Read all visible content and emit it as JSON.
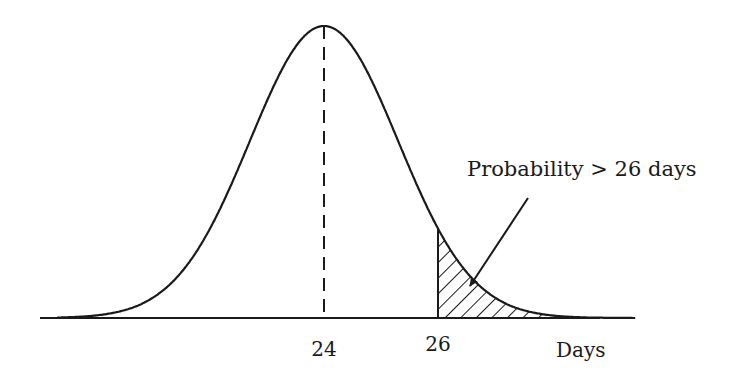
{
  "chart_data": {
    "type": "area",
    "title": "",
    "subtitle": "",
    "distribution": "normal",
    "mean": 24,
    "std_dev_estimate": 1.3,
    "xlabel": "Days",
    "ylabel": "",
    "x_ticks": [
      {
        "value": 24,
        "label": "24"
      },
      {
        "value": 26,
        "label": "26"
      }
    ],
    "shaded_region": {
      "from": 26,
      "to": "infinity",
      "pattern": "diagonal-hatch"
    },
    "mean_line": {
      "x": 24,
      "style": "dashed"
    },
    "annotations": [
      {
        "text": "Probability > 26 days",
        "points_to": "shaded_region",
        "arrow": true
      }
    ],
    "grid": false,
    "legend": null
  },
  "labels": {
    "tick_mean": "24",
    "tick_threshold": "26",
    "x_axis_label": "Days",
    "annotation": "Probability > 26 days"
  },
  "colors": {
    "ink": "#1a1a1a",
    "background": "#ffffff"
  }
}
